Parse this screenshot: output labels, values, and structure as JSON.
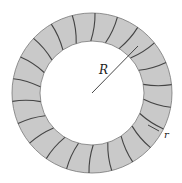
{
  "diagram": {
    "type": "toroid-winding",
    "center": {
      "x": 92,
      "y": 93
    },
    "outer_radius": 80,
    "inner_radius": 52,
    "winding_count": 22,
    "colors": {
      "core_fill": "#c9c9c9",
      "outline": "#555555",
      "winding": "#444444",
      "background": "#ffffff"
    },
    "labels": {
      "major_radius": "R",
      "minor_radius": "r"
    }
  }
}
